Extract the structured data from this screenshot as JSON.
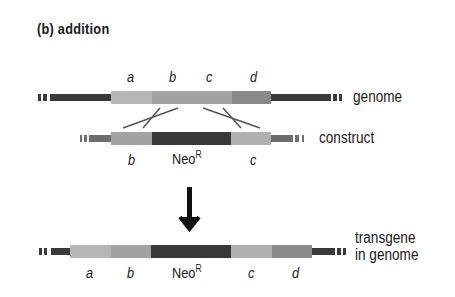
{
  "title": "(b)  addition",
  "genome": {
    "label": "genome",
    "segment_labels": [
      "a",
      "b",
      "c",
      "d"
    ]
  },
  "construct": {
    "label": "construct",
    "segment_labels": {
      "left": "b",
      "marker": "Neo",
      "marker_sup": "R",
      "right": "c"
    }
  },
  "transgene": {
    "label_line1": "transgene",
    "label_line2": "in genome",
    "segment_labels": {
      "a": "a",
      "b": "b",
      "marker": "Neo",
      "marker_sup": "R",
      "c": "c",
      "d": "d"
    }
  },
  "colors": {
    "flank_dark": "#3a3a3a",
    "flank_gray": "#6e6e6e",
    "seg_a_light": "#b5b5b5",
    "seg_bc_mid": "#a3a3a3",
    "seg_d": "#8a8a8a",
    "neo_dark": "#383838",
    "arrow": "#111111"
  }
}
